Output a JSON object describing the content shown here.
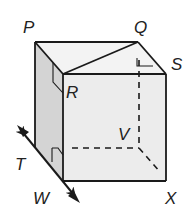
{
  "diagram": {
    "title": "",
    "colors": {
      "line": "#1a1a1a",
      "front_face": "#ececec",
      "left_face": "#d4d4d4",
      "top_face": "#f3f3f3",
      "label": "#222222"
    },
    "labels": {
      "P": "P",
      "Q": "Q",
      "R": "R",
      "S": "S",
      "T": "T",
      "V": "V",
      "W": "W",
      "X": "X"
    },
    "vertices": {
      "P": [
        35,
        42
      ],
      "Q": [
        138,
        42
      ],
      "R": [
        63,
        74
      ],
      "S": [
        166,
        74
      ],
      "T": [
        35,
        148
      ],
      "V": [
        139,
        148
      ],
      "W": [
        63,
        181
      ],
      "X": [
        166,
        181
      ]
    },
    "edges_solid": [
      [
        "P",
        "Q"
      ],
      [
        "P",
        "R"
      ],
      [
        "Q",
        "S"
      ],
      [
        "R",
        "S"
      ],
      [
        "R",
        "Q"
      ],
      [
        "P",
        "T"
      ],
      [
        "R",
        "W"
      ],
      [
        "S",
        "X"
      ],
      [
        "W",
        "X"
      ]
    ],
    "edges_dashed": [
      [
        "Q",
        "V"
      ],
      [
        "T",
        "V"
      ],
      [
        "V",
        "X"
      ]
    ],
    "line_TW": {
      "description": "double-headed line through T and W",
      "from": [
        17,
        125
      ],
      "to": [
        80,
        202
      ]
    },
    "right_angle_marks": [
      "at R on face PRWT",
      "at Q on plane QSV",
      "at T on face PRWT"
    ]
  }
}
